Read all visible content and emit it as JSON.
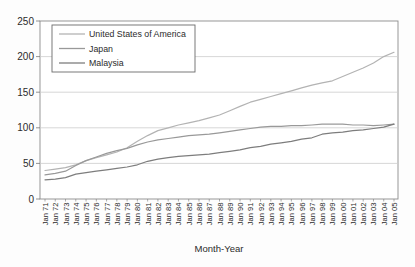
{
  "figure": {
    "background": "#fdfdfd",
    "plot_background": "#ffffff",
    "border_color": "#8c8c8c",
    "grid_color": "#cdcdcd",
    "tick_color": "#777777",
    "text_color": "#2b2b2b"
  },
  "chart_data": {
    "type": "line",
    "title": "",
    "xlabel": "Month-Year",
    "ylabel": "",
    "ylim": [
      0,
      250
    ],
    "yticks": [
      0,
      50,
      100,
      150,
      200,
      250
    ],
    "grid": "horizontal",
    "legend_position": "top-left-inside",
    "x_tick_labels": [
      "Jan 71",
      "Jan 72",
      "Jan 73",
      "Jan 74",
      "Jan 75",
      "Jan 76",
      "Jan 77",
      "Jan 78",
      "Jan 79",
      "Jan 80",
      "Jan 81",
      "Jan 82",
      "Jan 83",
      "Jan 84",
      "Jan 85",
      "Jan 86",
      "Jan 87",
      "Jan 88",
      "Jan 89",
      "Jan 90",
      "Jan 91",
      "Jan 92",
      "Jan 93",
      "Jan 94",
      "Jan 95",
      "Jan 96",
      "Jan 97",
      "Jan 98",
      "Jan 99",
      "Jan 00",
      "Jan 01",
      "Jan 02",
      "Jan 03",
      "Jan 04",
      "Jan 05"
    ],
    "series": [
      {
        "name": "United States of America",
        "color": "#b3b3b3",
        "values": [
          40,
          42,
          44,
          48,
          54,
          58,
          62,
          66,
          72,
          81,
          89,
          96,
          100,
          104,
          107,
          110,
          114,
          118,
          124,
          130,
          136,
          140,
          144,
          148,
          152,
          156,
          160,
          163,
          166,
          172,
          178,
          184,
          191,
          200,
          206
        ]
      },
      {
        "name": "Japan",
        "color": "#999999",
        "values": [
          34,
          36,
          39,
          47,
          54,
          59,
          64,
          68,
          71,
          76,
          80,
          83,
          85,
          87,
          89,
          90,
          91,
          93,
          95,
          97,
          99,
          101,
          102,
          102,
          103,
          103,
          104,
          105,
          105,
          105,
          104,
          104,
          103,
          104,
          105
        ]
      },
      {
        "name": "Malaysia",
        "color": "#7d7d7d",
        "values": [
          27,
          28,
          30,
          35,
          37,
          39,
          41,
          43,
          45,
          48,
          53,
          56,
          58,
          60,
          61,
          62,
          63,
          65,
          67,
          69,
          72,
          74,
          77,
          79,
          81,
          84,
          86,
          91,
          93,
          94,
          96,
          97,
          99,
          101,
          105
        ]
      }
    ]
  }
}
